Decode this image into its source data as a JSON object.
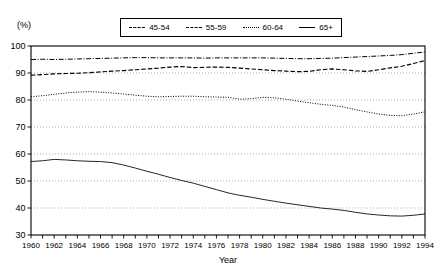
{
  "axis_unit_label": "(%)",
  "legend": {
    "items": [
      {
        "label": "45-54",
        "style": "dash-dot"
      },
      {
        "label": "55-59",
        "style": "dashed"
      },
      {
        "label": "60-64",
        "style": "dotted"
      },
      {
        "label": "65+",
        "style": "solid"
      }
    ]
  },
  "chart_data": {
    "type": "line",
    "title": "",
    "subtitle": "",
    "xlabel": "Year",
    "ylabel": "(%)",
    "xlim": [
      1960,
      1994
    ],
    "ylim": [
      30,
      100
    ],
    "yticks": [
      30,
      40,
      50,
      60,
      70,
      80,
      90,
      100
    ],
    "ytick_labels": [
      "30",
      "40",
      "50",
      "60",
      "70",
      "80",
      "90",
      "100"
    ],
    "xticks": [
      1960,
      1962,
      1964,
      1966,
      1968,
      1970,
      1972,
      1974,
      1976,
      1978,
      1980,
      1982,
      1984,
      1986,
      1988,
      1990,
      1992,
      1994
    ],
    "xtick_labels": [
      "1960",
      "1962",
      "1964",
      "1966",
      "1968",
      "1970",
      "1972",
      "1974",
      "1976",
      "1978",
      "1980",
      "1982",
      "1984",
      "1986",
      "1988",
      "1990",
      "1992",
      "1994"
    ],
    "minor_xticks_every": 1,
    "grid": "horizontal-dotted",
    "legend_position": "top-center",
    "x": [
      1960,
      1961,
      1962,
      1963,
      1964,
      1965,
      1966,
      1967,
      1968,
      1969,
      1970,
      1971,
      1972,
      1973,
      1974,
      1975,
      1976,
      1977,
      1978,
      1979,
      1980,
      1981,
      1982,
      1983,
      1984,
      1985,
      1986,
      1987,
      1988,
      1989,
      1990,
      1991,
      1992,
      1993,
      1994
    ],
    "series": [
      {
        "name": "45-54",
        "style": "dash-dot",
        "values": [
          95.0,
          95.1,
          95.0,
          95.1,
          95.2,
          95.3,
          95.4,
          95.5,
          95.6,
          95.7,
          95.7,
          95.6,
          95.6,
          95.6,
          95.6,
          95.5,
          95.6,
          95.6,
          95.6,
          95.6,
          95.6,
          95.5,
          95.4,
          95.3,
          95.3,
          95.4,
          95.5,
          95.7,
          95.9,
          96.1,
          96.3,
          96.5,
          96.8,
          97.3,
          97.8
        ]
      },
      {
        "name": "55-59",
        "style": "dashed",
        "values": [
          89.2,
          89.4,
          89.7,
          89.8,
          89.9,
          90.1,
          90.4,
          90.7,
          90.9,
          91.2,
          91.5,
          91.8,
          92.2,
          92.4,
          92.0,
          92.1,
          92.2,
          92.1,
          91.8,
          91.5,
          91.2,
          90.9,
          90.7,
          90.5,
          90.6,
          91.2,
          91.5,
          91.2,
          90.8,
          90.6,
          91.2,
          91.9,
          92.5,
          93.5,
          94.6
        ]
      },
      {
        "name": "60-64",
        "style": "dotted",
        "values": [
          81.2,
          81.6,
          82.1,
          82.6,
          82.9,
          83.1,
          82.9,
          82.6,
          82.2,
          81.8,
          81.4,
          81.2,
          81.3,
          81.4,
          81.4,
          81.2,
          81.1,
          81.0,
          80.3,
          80.5,
          81.0,
          80.8,
          80.3,
          79.6,
          79.0,
          78.4,
          78.0,
          77.4,
          76.4,
          75.6,
          74.8,
          74.3,
          74.2,
          74.8,
          75.6
        ]
      },
      {
        "name": "65+",
        "style": "solid",
        "values": [
          57.2,
          57.5,
          58.0,
          57.8,
          57.5,
          57.3,
          57.2,
          56.8,
          55.9,
          54.8,
          53.6,
          52.5,
          51.3,
          50.2,
          49.2,
          48.0,
          46.8,
          45.6,
          44.7,
          44.0,
          43.2,
          42.5,
          41.8,
          41.2,
          40.6,
          40.0,
          39.6,
          39.1,
          38.4,
          37.8,
          37.4,
          37.1,
          37.0,
          37.3,
          37.8
        ]
      }
    ]
  }
}
